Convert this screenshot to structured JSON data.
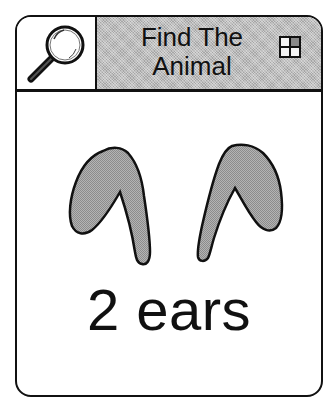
{
  "header": {
    "search_icon": "magnifying-glass-icon",
    "title_line1": "Find The",
    "title_line2": "Animal",
    "grid_icon": "grid-quadrant-icon"
  },
  "content": {
    "illustration": "two-ears",
    "caption": "2 ears"
  },
  "colors": {
    "border": "#111111",
    "header_fill": "#bdbdbd",
    "ear_fill": "#a8a8a8",
    "background": "#ffffff"
  }
}
